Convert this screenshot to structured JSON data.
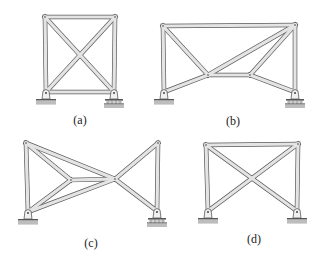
{
  "figure": {
    "colors": {
      "member_fill": "#e4e4e4",
      "member_stroke": "#5a5a5a",
      "ground": "#bdbdbd",
      "label": "#222222"
    },
    "panels": [
      {
        "id": "a",
        "label": "(a)",
        "label_pos": [
          80,
          113
        ],
        "nodes": {
          "TL": [
            45,
            17
          ],
          "TR": [
            115,
            17
          ],
          "BL": [
            46,
            92
          ],
          "BR": [
            114,
            92
          ]
        },
        "members": [
          [
            "TL",
            "TR"
          ],
          [
            "TL",
            "BL"
          ],
          [
            "TR",
            "BR"
          ],
          [
            "BL",
            "BR"
          ],
          [
            "TL",
            "BR"
          ],
          [
            "TR",
            "BL"
          ]
        ],
        "supports": [
          {
            "node": "BL",
            "type": "pin"
          },
          {
            "node": "BR",
            "type": "roller"
          }
        ]
      },
      {
        "id": "b",
        "label": "(b)",
        "label_pos": [
          233,
          114
        ],
        "nodes": {
          "TL": [
            163,
            26
          ],
          "TR": [
            295,
            25
          ],
          "BL": [
            164,
            92
          ],
          "BR": [
            295,
            92
          ],
          "ML": [
            208,
            75
          ],
          "MR": [
            250,
            75
          ]
        },
        "members": [
          [
            "TL",
            "TR"
          ],
          [
            "TL",
            "BL"
          ],
          [
            "TR",
            "BR"
          ],
          [
            "TL",
            "ML"
          ],
          [
            "BL",
            "ML"
          ],
          [
            "ML",
            "MR"
          ],
          [
            "ML",
            "TR"
          ],
          [
            "MR",
            "TR"
          ],
          [
            "MR",
            "BR"
          ]
        ],
        "supports": [
          {
            "node": "BL",
            "type": "pin"
          },
          {
            "node": "BR",
            "type": "roller"
          }
        ]
      },
      {
        "id": "c",
        "label": "(c)",
        "label_pos": [
          91,
          236
        ],
        "nodes": {
          "TL": [
            26,
            143
          ],
          "BL": [
            28,
            212
          ],
          "ML": [
            71,
            180
          ],
          "MR": [
            115,
            179
          ],
          "TR": [
            158,
            143
          ],
          "BR": [
            157,
            211
          ]
        },
        "members": [
          [
            "TL",
            "BL"
          ],
          [
            "TL",
            "ML"
          ],
          [
            "BL",
            "ML"
          ],
          [
            "ML",
            "MR"
          ],
          [
            "TL",
            "MR"
          ],
          [
            "BL",
            "MR"
          ],
          [
            "MR",
            "TR"
          ],
          [
            "MR",
            "BR"
          ],
          [
            "TR",
            "BR"
          ]
        ],
        "supports": [
          {
            "node": "BL",
            "type": "pin"
          },
          {
            "node": "BR",
            "type": "roller"
          }
        ]
      },
      {
        "id": "d",
        "label": "(d)",
        "label_pos": [
          254,
          232
        ],
        "nodes": {
          "TL": [
            206,
            145
          ],
          "TR": [
            298,
            144
          ],
          "BL": [
            208,
            211
          ],
          "BR": [
            297,
            211
          ]
        },
        "members": [
          [
            "TL",
            "TR"
          ],
          [
            "TL",
            "BL"
          ],
          [
            "TR",
            "BR"
          ],
          [
            "TL",
            "BR"
          ],
          [
            "TR",
            "BL"
          ]
        ],
        "supports": [
          {
            "node": "BL",
            "type": "pin"
          },
          {
            "node": "BR",
            "type": "pin"
          }
        ]
      }
    ]
  }
}
